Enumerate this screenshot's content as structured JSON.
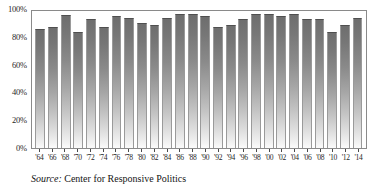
{
  "figure": {
    "background": "#ffffff",
    "bar_color_top": "#6e6e6e",
    "bar_color_bottom": "#fbfbfb",
    "axis_color": "#8a8a8a"
  },
  "source_note": {
    "label": "Source:",
    "text": " Center for Responsive Politics"
  },
  "chart_data": {
    "type": "bar",
    "title": "",
    "subtitle": "",
    "xlabel": "",
    "ylabel": "",
    "ylim": [
      0,
      100
    ],
    "yticks": [
      0,
      20,
      40,
      60,
      80,
      100
    ],
    "ytick_labels": [
      "0%",
      "20%",
      "40%",
      "60%",
      "80%",
      "100%"
    ],
    "grid": false,
    "legend": null,
    "categories": [
      "'64",
      "'66",
      "'68",
      "'70",
      "'72",
      "'74",
      "'76",
      "'78",
      "'80",
      "'82",
      "'84",
      "'86",
      "'88",
      "'90",
      "'92",
      "'94",
      "'96",
      "'98",
      "'00",
      "'02",
      "'04",
      "'06",
      "'08",
      "'10",
      "'12",
      "'14"
    ],
    "values": [
      87,
      88,
      97,
      85,
      94,
      88,
      96,
      95,
      91,
      90,
      95,
      98,
      98,
      96,
      88,
      90,
      94,
      98,
      98,
      96,
      98,
      94,
      94,
      85,
      90,
      95
    ],
    "annotations": []
  }
}
